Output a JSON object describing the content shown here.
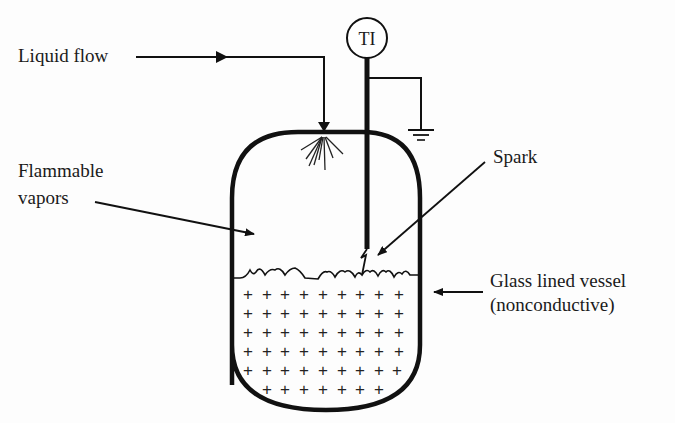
{
  "diagram": {
    "labels": {
      "liquid_flow": "Liquid flow",
      "flammable_line1": "Flammable",
      "flammable_line2": "vapors",
      "spark": "Spark",
      "vessel_line1": "Glass lined vessel",
      "vessel_line2": "(nonconductive)",
      "instrument": "TI"
    },
    "components": [
      {
        "id": "vessel",
        "type": "vessel",
        "description": "Glass lined vessel (nonconductive)"
      },
      {
        "id": "ti",
        "type": "instrument",
        "tag": "TI",
        "description": "Temperature indicator with probe into vessel"
      },
      {
        "id": "ground",
        "type": "electrical-ground",
        "connected_to": "ti"
      },
      {
        "id": "spray",
        "type": "spray-inlet",
        "fed_by": "Liquid flow"
      },
      {
        "id": "liquid",
        "type": "charged-liquid",
        "symbol": "+"
      },
      {
        "id": "spark",
        "type": "discharge",
        "between": [
          "ti-probe",
          "liquid-surface"
        ]
      }
    ],
    "colors": {
      "ink": "#111111",
      "background": "#fdfdfd"
    }
  }
}
